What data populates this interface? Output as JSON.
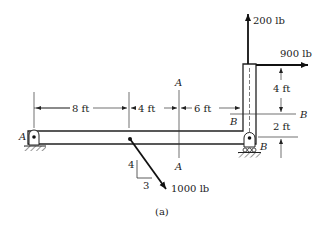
{
  "figure": {
    "caption": "(a)",
    "loads": {
      "vertical_force": "200 lb",
      "horizontal_force": "900 lb",
      "inclined_force": "1000 lb",
      "slope_rise": "4",
      "slope_run": "3"
    },
    "dimensions": {
      "d1": "8 ft",
      "d2": "4 ft",
      "d3": "6 ft",
      "h1": "4 ft",
      "h2": "2 ft"
    },
    "supports": {
      "left": "A",
      "right": "B"
    },
    "sections": {
      "aa_top": "A",
      "aa_bottom": "A",
      "bb_left": "B",
      "bb_right": "B"
    }
  }
}
